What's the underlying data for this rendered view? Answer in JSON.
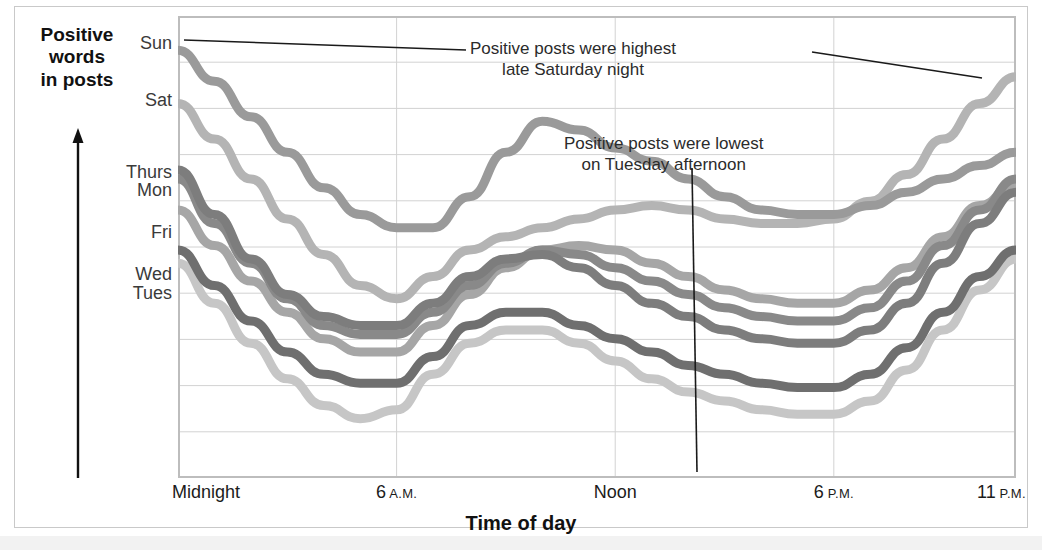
{
  "axis": {
    "y_caption_lines": [
      "Positive",
      "words",
      "in posts"
    ],
    "y_caption": "Positive words in posts",
    "x_title": "Time of day"
  },
  "x_ticks": [
    {
      "label": "Midnight",
      "small": "",
      "hour": 0
    },
    {
      "label": "6",
      "small": "A.M.",
      "hour": 6
    },
    {
      "label": "Noon",
      "small": "",
      "hour": 12
    },
    {
      "label": "6",
      "small": "P.M.",
      "hour": 18
    },
    {
      "label": "11",
      "small": "P.M.",
      "hour": 23
    }
  ],
  "annotations": [
    {
      "id": "highest",
      "line1": "Positive posts were highest",
      "line2": "late Saturday night"
    },
    {
      "id": "lowest",
      "line1": "Positive posts were lowest",
      "line2": "on Tuesday afternoon"
    }
  ],
  "series_labels": [
    {
      "label": "Sun",
      "top": 33
    },
    {
      "label": "Sat",
      "top": 90
    },
    {
      "label": "Thurs",
      "top": 162
    },
    {
      "label": "Mon",
      "top": 180
    },
    {
      "label": "Fri",
      "top": 222
    },
    {
      "label": "Wed",
      "top": 264
    },
    {
      "label": "Tues",
      "top": 283
    }
  ],
  "colors": {
    "sun": "#9a9a9a",
    "sat": "#b4b4b4",
    "thurs": "#7d7d7d",
    "mon": "#898989",
    "fri": "#a6a6a6",
    "wed": "#6f6f6f",
    "tues": "#c6c6c6",
    "grid": "#d2d2d2",
    "frame": "#bdbdbd",
    "annotation_leader": "#1a1a1a",
    "text": "#1b1b1b"
  },
  "chart_data": {
    "type": "line",
    "title": "",
    "xlabel": "Time of day",
    "ylabel": "Positive words in posts",
    "xlim": [
      0,
      23
    ],
    "ylim": [
      0,
      100
    ],
    "grid": true,
    "legend": "inline-left-labels",
    "x": [
      0,
      1,
      2,
      3,
      4,
      5,
      6,
      7,
      8,
      9,
      10,
      11,
      12,
      13,
      14,
      15,
      16,
      17,
      18,
      19,
      20,
      21,
      22,
      23
    ],
    "series": [
      {
        "name": "Sun",
        "color": "#9a9a9a",
        "values": [
          95,
          88,
          80,
          72,
          64,
          58,
          55,
          55,
          62,
          72,
          79,
          77,
          73,
          70,
          66,
          62,
          59,
          58,
          58,
          60,
          63,
          66,
          69,
          72
        ]
      },
      {
        "name": "Sat",
        "color": "#b4b4b4",
        "values": [
          83,
          75,
          66,
          57,
          49,
          42,
          39,
          44,
          50,
          53,
          55,
          57,
          59,
          60,
          59,
          57,
          56,
          56,
          57,
          61,
          67,
          75,
          83,
          89
        ]
      },
      {
        "name": "Thurs",
        "color": "#7d7d7d",
        "values": [
          68,
          58,
          48,
          40,
          35,
          33,
          33,
          38,
          44,
          48,
          49,
          46,
          42,
          38,
          35,
          32,
          30,
          29,
          29,
          32,
          38,
          47,
          56,
          63
        ]
      },
      {
        "name": "Mon",
        "color": "#898989",
        "values": [
          66,
          56,
          47,
          39,
          33,
          31,
          31,
          36,
          42,
          47,
          50,
          49,
          46,
          43,
          40,
          37,
          35,
          34,
          34,
          37,
          43,
          51,
          59,
          66
        ]
      },
      {
        "name": "Fri",
        "color": "#a6a6a6",
        "values": [
          59,
          51,
          43,
          36,
          30,
          27,
          27,
          33,
          40,
          46,
          50,
          51,
          50,
          47,
          44,
          41,
          39,
          38,
          38,
          41,
          46,
          53,
          60,
          65
        ]
      },
      {
        "name": "Wed",
        "color": "#6f6f6f",
        "values": [
          50,
          42,
          34,
          27,
          22,
          20,
          20,
          26,
          33,
          36,
          36,
          33,
          30,
          27,
          24,
          22,
          20,
          19,
          19,
          22,
          28,
          36,
          44,
          50
        ]
      },
      {
        "name": "Tues",
        "color": "#c6c6c6",
        "values": [
          47,
          38,
          29,
          21,
          15,
          12,
          14,
          22,
          29,
          32,
          32,
          29,
          25,
          21,
          18,
          16,
          14,
          13,
          13,
          16,
          23,
          32,
          41,
          48
        ]
      }
    ],
    "annotations": [
      {
        "text": "Positive posts were highest late Saturday night",
        "points_to": {
          "series": "Sat",
          "hour": 23
        }
      },
      {
        "text": "Positive posts were lowest on Tuesday afternoon",
        "points_to": {
          "series": "Tues",
          "hour": 16
        }
      }
    ]
  }
}
